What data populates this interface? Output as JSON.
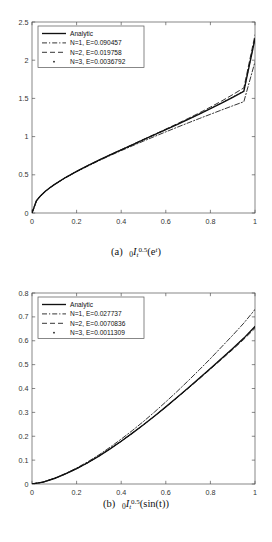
{
  "figure_label_a": "(a)",
  "figure_label_b": "(b)",
  "caption_a": {
    "prefix": "(a)",
    "presub": "0",
    "operator": "I",
    "sub": "t",
    "sup": "0.5",
    "argument": "(e",
    "arg_sup": "t",
    "arg_close": ")",
    "plain": "(a) 0I_t^0.5(e^t)"
  },
  "caption_b": {
    "prefix": "(b)",
    "presub": "0",
    "operator": "I",
    "sub": "t",
    "sup": "0.5",
    "argument": "(sin(t))",
    "plain": "(b) 0I_t^0.5(sin(t))"
  },
  "colors": {
    "axis": "#555555",
    "curve": "#111111",
    "tick_text": "#333333",
    "legend_border": "#555555",
    "background": "#ffffff"
  },
  "chart_data": [
    {
      "id": "chart-a",
      "type": "line",
      "title": "",
      "xlabel": "t",
      "ylabel": "",
      "xlim": [
        0,
        1
      ],
      "ylim": [
        0,
        2.5
      ],
      "xticks": [
        "0",
        "0.2",
        "0.4",
        "0.6",
        "0.8",
        "1"
      ],
      "xtick_values": [
        0,
        0.2,
        0.4,
        0.6,
        0.8,
        1
      ],
      "yticks": [
        "0",
        "0.5",
        "1",
        "1.5",
        "2",
        "2.5"
      ],
      "ytick_values": [
        0,
        0.5,
        1,
        1.5,
        2,
        2.5
      ],
      "grid": false,
      "legend_position": "upper-left",
      "x": [
        0,
        0.02,
        0.04,
        0.06,
        0.08,
        0.1,
        0.15,
        0.2,
        0.25,
        0.3,
        0.35,
        0.4,
        0.45,
        0.5,
        0.55,
        0.6,
        0.65,
        0.7,
        0.75,
        0.8,
        0.85,
        0.9,
        0.95,
        1
      ],
      "series": [
        {
          "name": "Analytic",
          "style": "solid",
          "error": null,
          "values": [
            0,
            0.161,
            0.23,
            0.284,
            0.33,
            0.372,
            0.464,
            0.545,
            0.62,
            0.691,
            0.76,
            0.827,
            0.893,
            0.959,
            1.025,
            1.091,
            1.157,
            1.225,
            1.294,
            1.365,
            1.438,
            1.514,
            1.593,
            2.282
          ]
        },
        {
          "name": "N=1, E=0.090457",
          "style": "dash-dot",
          "error": 0.090457,
          "values": [
            0,
            0.16,
            0.229,
            0.283,
            0.329,
            0.37,
            0.461,
            0.541,
            0.614,
            0.684,
            0.751,
            0.816,
            0.879,
            0.941,
            1.002,
            1.062,
            1.121,
            1.179,
            1.236,
            1.292,
            1.348,
            1.403,
            1.457,
            1.98
          ]
        },
        {
          "name": "N=2, E=0.019758",
          "style": "dashed",
          "error": 0.019758,
          "values": [
            0,
            0.161,
            0.23,
            0.284,
            0.33,
            0.372,
            0.464,
            0.545,
            0.62,
            0.692,
            0.761,
            0.829,
            0.896,
            0.963,
            1.03,
            1.098,
            1.167,
            1.237,
            1.31,
            1.386,
            1.465,
            1.549,
            1.638,
            2.33
          ]
        },
        {
          "name": "N=3, E=0.0036792",
          "style": "dotted",
          "error": 0.0036792,
          "values": [
            0,
            0.161,
            0.23,
            0.284,
            0.33,
            0.372,
            0.464,
            0.545,
            0.62,
            0.691,
            0.76,
            0.827,
            0.893,
            0.959,
            1.025,
            1.091,
            1.158,
            1.226,
            1.295,
            1.367,
            1.441,
            1.518,
            1.598,
            2.29
          ]
        }
      ],
      "endpoint_note": "analytic reaches ~2.28 at t=1; N=1 falls low to ~1.98"
    },
    {
      "id": "chart-b",
      "type": "line",
      "title": "",
      "xlabel": "t",
      "ylabel": "",
      "xlim": [
        0,
        1
      ],
      "ylim": [
        0,
        0.8
      ],
      "xticks": [
        "0",
        "0.2",
        "0.4",
        "0.6",
        "0.8",
        "1"
      ],
      "xtick_values": [
        0,
        0.2,
        0.4,
        0.6,
        0.8,
        1
      ],
      "yticks": [
        "0",
        "0.1",
        "0.2",
        "0.3",
        "0.4",
        "0.5",
        "0.6",
        "0.7",
        "0.8"
      ],
      "ytick_values": [
        0,
        0.1,
        0.2,
        0.3,
        0.4,
        0.5,
        0.6,
        0.7,
        0.8
      ],
      "grid": false,
      "legend_position": "upper-left",
      "x": [
        0,
        0.05,
        0.1,
        0.15,
        0.2,
        0.25,
        0.3,
        0.35,
        0.4,
        0.45,
        0.5,
        0.55,
        0.6,
        0.65,
        0.7,
        0.75,
        0.8,
        0.85,
        0.9,
        0.95,
        1
      ],
      "series": [
        {
          "name": "Analytic",
          "style": "solid",
          "error": null,
          "values": [
            0,
            0.008,
            0.023,
            0.042,
            0.064,
            0.089,
            0.117,
            0.147,
            0.179,
            0.213,
            0.248,
            0.285,
            0.323,
            0.362,
            0.402,
            0.443,
            0.484,
            0.526,
            0.568,
            0.611,
            0.66
          ]
        },
        {
          "name": "N=1, E=0.027737",
          "style": "dash-dot",
          "error": 0.027737,
          "values": [
            0,
            0.008,
            0.024,
            0.044,
            0.067,
            0.093,
            0.122,
            0.154,
            0.188,
            0.224,
            0.262,
            0.302,
            0.344,
            0.387,
            0.432,
            0.478,
            0.525,
            0.574,
            0.623,
            0.674,
            0.731
          ]
        },
        {
          "name": "N=2, E=0.0070836",
          "style": "dashed",
          "error": 0.0070836,
          "values": [
            0,
            0.008,
            0.023,
            0.042,
            0.064,
            0.089,
            0.117,
            0.147,
            0.179,
            0.213,
            0.248,
            0.285,
            0.322,
            0.361,
            0.4,
            0.44,
            0.481,
            0.522,
            0.563,
            0.606,
            0.652
          ]
        },
        {
          "name": "N=3, E=0.0011309",
          "style": "dotted",
          "error": 0.0011309,
          "values": [
            0,
            0.008,
            0.023,
            0.042,
            0.064,
            0.089,
            0.117,
            0.147,
            0.179,
            0.213,
            0.248,
            0.285,
            0.323,
            0.362,
            0.402,
            0.443,
            0.484,
            0.526,
            0.568,
            0.611,
            0.658
          ]
        }
      ],
      "endpoint_note": "analytic reaches ~0.66 at t=1; N=1 overshoots to ~0.73"
    }
  ],
  "legend_a": [
    {
      "label": "Analytic",
      "style": "solid"
    },
    {
      "label": "N=1, E=0.090457",
      "style": "dash-dot"
    },
    {
      "label": "N=2, E=0.019758",
      "style": "dashed"
    },
    {
      "label": "N=3, E=0.0036792",
      "style": "dotted"
    }
  ],
  "legend_b": [
    {
      "label": "Analytic",
      "style": "solid"
    },
    {
      "label": "N=1, E=0.027737",
      "style": "dash-dot"
    },
    {
      "label": "N=2, E=0.0070836",
      "style": "dashed"
    },
    {
      "label": "N=3, E=0.0011309",
      "style": "dotted"
    }
  ]
}
